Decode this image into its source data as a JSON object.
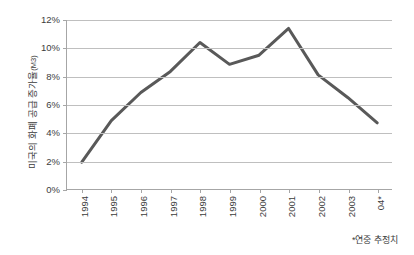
{
  "chart_data": {
    "type": "line",
    "title": "",
    "subtitle": "",
    "xlabel": "",
    "ylabel": "미국의 화폐 공급 증가율",
    "ylabel_unit": "(M3)",
    "categories": [
      "1994",
      "1995",
      "1996",
      "1997",
      "1998",
      "1999",
      "2000",
      "2001",
      "2002",
      "2003",
      "04*"
    ],
    "values": [
      1.9,
      4.85,
      6.85,
      8.35,
      10.4,
      8.85,
      9.5,
      11.4,
      8.1,
      6.5,
      4.7
    ],
    "series": [
      {
        "name": "미국의 화폐 공급 증가율(M3)",
        "values": [
          1.9,
          4.85,
          6.85,
          8.35,
          10.4,
          8.85,
          9.5,
          11.4,
          8.1,
          6.5,
          4.7
        ]
      }
    ],
    "ylim": [
      0,
      12
    ],
    "ytick_values": [
      0,
      2,
      4,
      6,
      8,
      10,
      12
    ],
    "ytick_labels": [
      "0%",
      "2%",
      "4%",
      "6%",
      "8%",
      "10%",
      "12%"
    ],
    "grid": true,
    "grid_axis": "y",
    "legend": false,
    "legend_position": "none",
    "markers": false,
    "annotations": [
      "*연중 추정치"
    ],
    "line_color": "#595959",
    "grid_color": "#bfbfbf",
    "axis_color": "#a6a6a6",
    "background_color": "#ffffff"
  },
  "footnote": {
    "text": "*연중 추정치"
  }
}
